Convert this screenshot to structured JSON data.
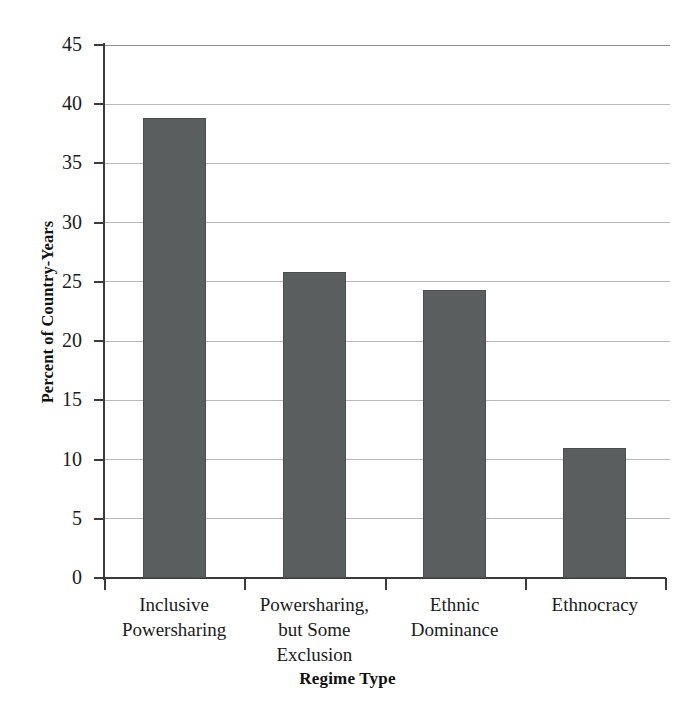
{
  "chart_data": {
    "type": "bar",
    "title": "",
    "xlabel": "Regime Type",
    "ylabel": "Percent of Country-Years",
    "categories": [
      "Inclusive Powersharing",
      "Powersharing, but Some Exclusion",
      "Ethnic Dominance",
      "Ethnocracy"
    ],
    "category_lines": [
      [
        "Inclusive",
        "Powersharing"
      ],
      [
        "Powersharing,",
        "but Some",
        "Exclusion"
      ],
      [
        "Ethnic",
        "Dominance"
      ],
      [
        "Ethnocracy"
      ]
    ],
    "values": [
      38.8,
      25.8,
      24.3,
      11.0
    ],
    "ylim": [
      0,
      45
    ],
    "ytick_values": [
      0,
      5,
      10,
      15,
      20,
      25,
      30,
      35,
      40,
      45
    ],
    "ytick_labels": [
      "0",
      "5",
      "10",
      "15",
      "20",
      "25",
      "30",
      "35",
      "40",
      "45"
    ],
    "grid": true,
    "legend": false,
    "bar_color": "#5a5e5e",
    "gridline_color": "#b9b9b9",
    "axis_color": "#3a3a3a",
    "background_color": "#ffffff"
  }
}
